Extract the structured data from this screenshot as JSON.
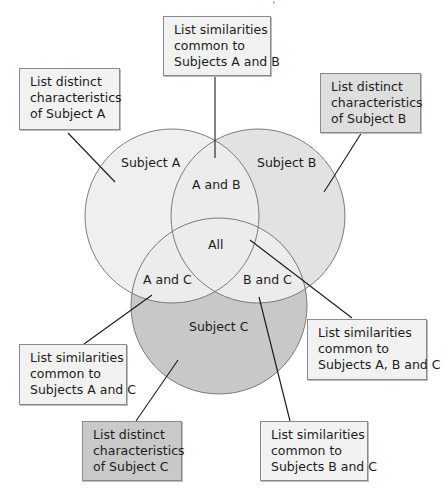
{
  "figure": {
    "top_fragment": "· , ·",
    "colors": {
      "circle_a": "#efefef",
      "circle_b": "#e2e2e2",
      "circle_c": "#c8c8c8",
      "overlap_light": "#ececec",
      "stroke": "#6e6e6e",
      "leader": "#1a1a1a"
    }
  },
  "regions": {
    "subject_a": "Subject A",
    "subject_b": "Subject B",
    "subject_c": "Subject C",
    "a_and_b": "A and B",
    "a_and_c": "A and C",
    "b_and_c": "B and C",
    "all": "All"
  },
  "boxes": {
    "ab": [
      "List similarities",
      "common to",
      "Subjects A and B"
    ],
    "a": [
      "List distinct",
      "characteristics",
      "of Subject A"
    ],
    "b": [
      "List distinct",
      "characteristics",
      "of Subject B"
    ],
    "ac": [
      "List similarities",
      "common to",
      "Subjects A and C"
    ],
    "abc": [
      "List similarities",
      "common to",
      "Subjects A, B and C"
    ],
    "c": [
      "List distinct",
      "characteristics",
      "of Subject C"
    ],
    "bc": [
      "List similarities",
      "common to",
      "Subjects B and C"
    ]
  }
}
